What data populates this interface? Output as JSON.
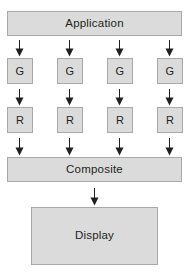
{
  "diagram": {
    "type": "flow-diagram",
    "title_text": "",
    "colors": {
      "node_fill": "#dbdbdb",
      "node_border": "#a9a9a9",
      "text": "#231f20",
      "arrow": "#231f20",
      "background": "#ffffff"
    },
    "nodes": {
      "application": {
        "label": "Application"
      },
      "geometry": [
        {
          "label": "G"
        },
        {
          "label": "G"
        },
        {
          "label": "G"
        },
        {
          "label": "G"
        }
      ],
      "raster": [
        {
          "label": "R"
        },
        {
          "label": "R"
        },
        {
          "label": "R"
        },
        {
          "label": "R"
        }
      ],
      "composite": {
        "label": "Composite"
      },
      "display": {
        "label": "Display"
      }
    },
    "arrow_labels": {
      "application_to_geometry": "",
      "geometry_to_raster": "",
      "raster_to_composite": "",
      "composite_to_display": ""
    }
  }
}
